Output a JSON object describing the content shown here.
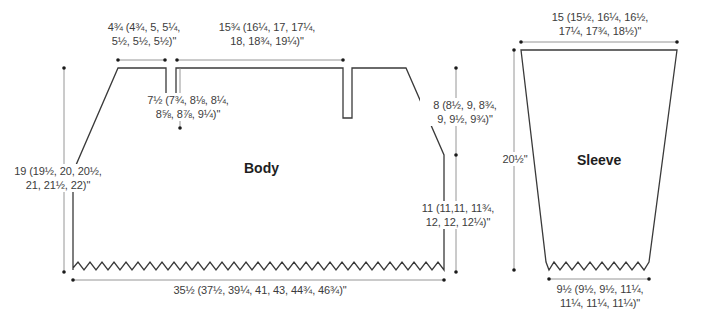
{
  "colors": {
    "outline": "#3a3a3a",
    "dimension_line": "#8a8a8a",
    "dot": "#1a1a1a",
    "text": "#3c3c3c"
  },
  "body": {
    "title": "Body",
    "measurements": {
      "shoulder_width": {
        "line1": "4¾ (4¾, 5, 5¼,",
        "line2": "5½, 5½, 5½)\""
      },
      "back_neck_width": {
        "line1": "15¾ (16¼, 17, 17¼,",
        "line2": "18, 18¾, 19¼)\""
      },
      "neck_slit_depth": {
        "line1": "7½ (7¾, 8⅛, 8¼,",
        "line2": "8⅝, 8⅞, 9¼)\""
      },
      "armhole_depth": {
        "line1": "8 (8½, 9, 8¾,",
        "line2": "9, 9½, 9¾)\""
      },
      "total_length": {
        "line1": "19 (19½, 20, 20½,",
        "line2": "21, 21½, 22)\""
      },
      "side_length": {
        "line1": "11 (11,11, 11¾,",
        "line2": "12, 12, 12¼)\""
      },
      "hem_width": {
        "line1": "35½ (37½, 39¼, 41, 43, 44¾, 46¾)\""
      }
    }
  },
  "sleeve": {
    "title": "Sleeve",
    "measurements": {
      "top_width": {
        "line1": "15 (15½, 16¼, 16½,",
        "line2": "17¼, 17¾, 18½)\""
      },
      "length": {
        "line1": "20½\""
      },
      "cuff_width": {
        "line1": "9½ (9½, 9½, 11¼,",
        "line2": "11¼, 11¼, 11¼)\""
      }
    }
  }
}
